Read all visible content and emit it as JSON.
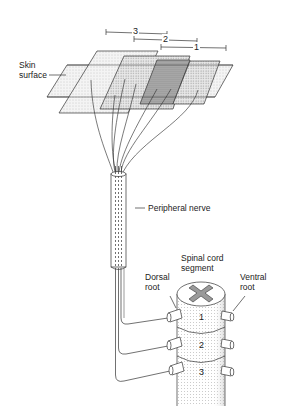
{
  "diagram": {
    "type": "anatomical-illustration",
    "labels": {
      "skin_surface": "Skin\nsurface",
      "peripheral_nerve": "Peripheral nerve",
      "spinal_cord_segment": "Spinal cord\nsegment",
      "dorsal_root": "Dorsal\nroot",
      "ventral_root": "Ventral\nroot"
    },
    "dermatome_brackets": [
      {
        "label": "3"
      },
      {
        "label": "2"
      },
      {
        "label": "1"
      }
    ],
    "spinal_segments": [
      {
        "label": "1"
      },
      {
        "label": "2"
      },
      {
        "label": "3"
      }
    ],
    "colors": {
      "line": "#333333",
      "stipple_light": "#e6e6e6",
      "stipple_dark": "#a9a9a9",
      "background": "#ffffff"
    }
  }
}
